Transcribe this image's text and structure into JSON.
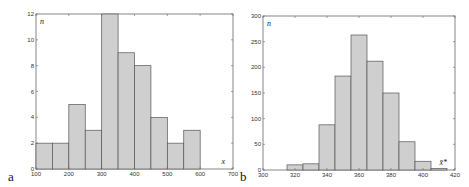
{
  "chart_data": [
    {
      "type": "bar",
      "panel_label": "a",
      "title": "",
      "xlabel": "x",
      "ylabel": "n",
      "xlim": [
        100,
        700
      ],
      "ylim": [
        0,
        12
      ],
      "x_ticks": [
        "100",
        "200",
        "300",
        "400",
        "500",
        "600",
        "700"
      ],
      "y_ticks": [
        "0",
        "2",
        "4",
        "6",
        "8",
        "10",
        "12"
      ],
      "bin_width": 50,
      "bin_edges": [
        100,
        150,
        200,
        250,
        300,
        350,
        400,
        450,
        500,
        550,
        600
      ],
      "values": [
        2,
        2,
        5,
        3,
        12,
        9,
        8,
        4,
        2,
        3
      ],
      "grid": false,
      "bar_color": "#cfcfcf",
      "edge_color": "#555555"
    },
    {
      "type": "bar",
      "panel_label": "b",
      "title": "",
      "xlabel": "x̄*",
      "ylabel": "n",
      "xlim": [
        300,
        420
      ],
      "ylim": [
        0,
        300
      ],
      "x_ticks": [
        "300",
        "320",
        "340",
        "360",
        "380",
        "400",
        "420"
      ],
      "y_ticks": [
        "0",
        "50",
        "100",
        "150",
        "200",
        "250",
        "300"
      ],
      "bin_width": 10,
      "bin_edges": [
        315,
        325,
        335,
        345,
        355,
        365,
        375,
        385,
        395,
        405,
        415
      ],
      "values": [
        10,
        12,
        88,
        183,
        263,
        212,
        150,
        55,
        17,
        3
      ],
      "grid": false,
      "bar_color": "#cfcfcf",
      "edge_color": "#555555"
    }
  ]
}
